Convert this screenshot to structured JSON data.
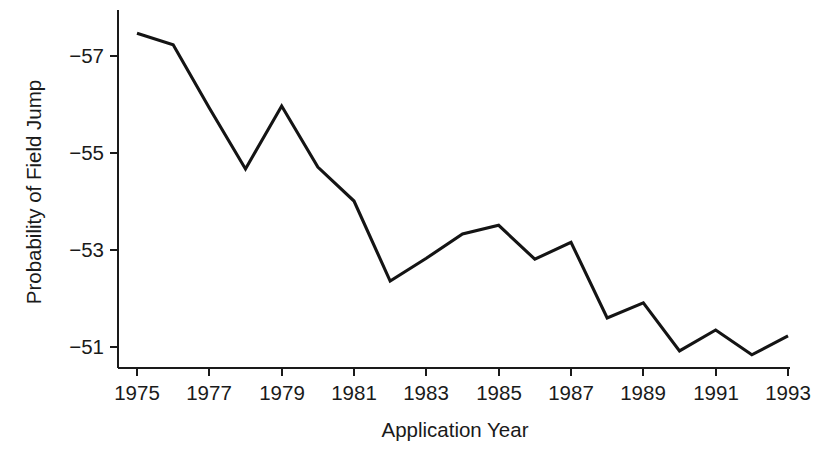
{
  "chart_data": {
    "type": "line",
    "title": "",
    "xlabel": "Application Year",
    "ylabel": "Probability of Field Jump",
    "xlim": [
      1974.4,
      1993.6
    ],
    "ylim": [
      -57.6,
      -50.6
    ],
    "y_axis_inverted": true,
    "grid": false,
    "legend": null,
    "x_tick_labels": [
      "1975",
      "1977",
      "1979",
      "1981",
      "1983",
      "1985",
      "1987",
      "1989",
      "1991",
      "1993"
    ],
    "x_tick_values": [
      1975,
      1977,
      1979,
      1981,
      1983,
      1985,
      1987,
      1989,
      1991,
      1993
    ],
    "y_tick_labels": [
      "−57",
      "−55",
      "−53",
      "−51"
    ],
    "y_tick_values": [
      -57,
      -55,
      -53,
      -51
    ],
    "line_color": "#141414",
    "x": [
      1975,
      1976,
      1977,
      1978,
      1979,
      1980,
      1981,
      1982,
      1983,
      1984,
      1985,
      1986,
      1987,
      1988,
      1989,
      1990,
      1991,
      1992,
      1993
    ],
    "values": [
      -57.47,
      -57.23,
      -55.93,
      -54.67,
      -55.97,
      -54.71,
      -54.01,
      -52.36,
      -52.83,
      -53.33,
      -53.51,
      -52.81,
      -53.16,
      -51.6,
      -51.91,
      -50.92,
      -51.35,
      -50.84,
      -51.23
    ],
    "series": [
      {
        "name": "Probability of Field Jump",
        "values": [
          -57.47,
          -57.23,
          -55.93,
          -54.67,
          -55.97,
          -54.71,
          -54.01,
          -52.36,
          -52.83,
          -53.33,
          -53.51,
          -52.81,
          -53.16,
          -51.6,
          -51.91,
          -50.92,
          -51.35,
          -50.84,
          -51.23
        ]
      }
    ]
  },
  "axes": {
    "x_axis_label": "Application Year",
    "y_axis_label": "Probability of Field Jump"
  }
}
